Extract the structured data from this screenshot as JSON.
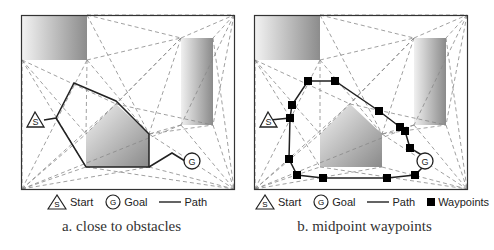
{
  "panels": [
    {
      "id": "a",
      "caption": "a. close to obstacles",
      "legend": {
        "start": "Start",
        "goal": "Goal",
        "path": "Path"
      },
      "start_label": "S",
      "goal_label": "G"
    },
    {
      "id": "b",
      "caption": "b. midpoint waypoints",
      "legend": {
        "start": "Start",
        "goal": "Goal",
        "path": "Path",
        "waypoints": "Waypoints"
      },
      "start_label": "S",
      "goal_label": "G"
    }
  ],
  "colors": {
    "frame": "#333333",
    "path": "#222222",
    "dashed": "#888888",
    "waypoint": "#000000"
  }
}
